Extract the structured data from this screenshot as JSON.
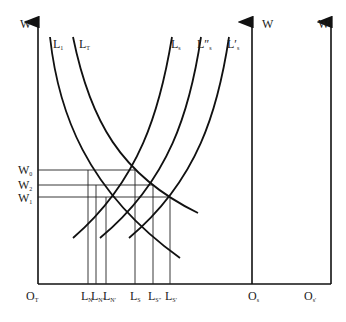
{
  "diagram": {
    "type": "labor-market-two-sector-diagram",
    "axes": {
      "left": {
        "label": "W",
        "origin": "O",
        "origin_sub": "T"
      },
      "middle": {
        "label": "W",
        "origin": "O",
        "origin_sub": "s"
      },
      "right": {
        "label": "W",
        "origin": "O",
        "origin_sub": "s'"
      }
    },
    "curves": {
      "demand": [
        {
          "label": "L",
          "sub": "1"
        },
        {
          "label": "L",
          "sub": "T"
        }
      ],
      "supply": [
        {
          "label": "L",
          "sub": "s"
        },
        {
          "label": "L″",
          "sub": "s"
        },
        {
          "label": "L′",
          "sub": "s"
        }
      ]
    },
    "wage_levels": [
      {
        "label": "W",
        "sub": "0"
      },
      {
        "label": "W",
        "sub": "2"
      },
      {
        "label": "W",
        "sub": "1"
      }
    ],
    "quantity_labels": [
      {
        "label": "L",
        "sub": "N"
      },
      {
        "label": "L",
        "sub": "N″"
      },
      {
        "label": "L",
        "sub": "N′"
      },
      {
        "label": "L",
        "sub": "S"
      },
      {
        "label": "L",
        "sub": "S″"
      },
      {
        "label": "L",
        "sub": "S′"
      }
    ]
  }
}
